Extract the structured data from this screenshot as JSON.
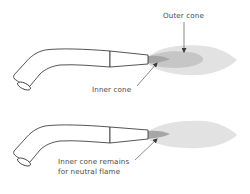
{
  "diagram": {
    "type": "oxy-acetylene torch flame diagram",
    "colors": {
      "outline": "#2a2a2a",
      "outer_flame": "#e2e2e2",
      "middle_cone": "#c6c6c6",
      "inner_cone": "#a6a6a6",
      "label_text": "#4a4a4a",
      "arrow": "#3a3a3a"
    },
    "panels": [
      {
        "id": "top",
        "labels": {
          "outer_cone": "Outer cone",
          "inner_cone": "Inner cone"
        }
      },
      {
        "id": "bottom",
        "labels": {
          "inner_cone_line1": "Inner cone remains",
          "inner_cone_line2": "for neutral flame"
        }
      }
    ]
  }
}
